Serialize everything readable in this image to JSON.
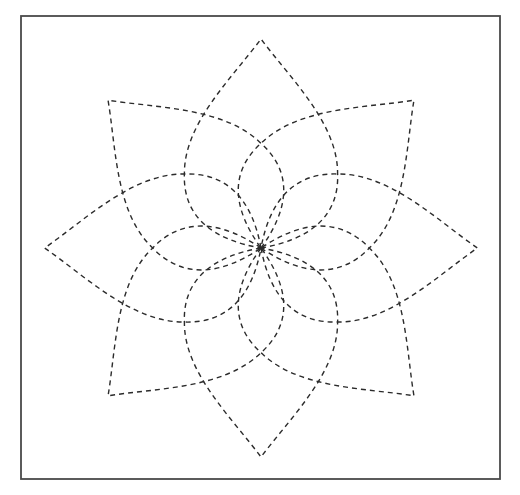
{
  "figure": {
    "title": "",
    "frame": {
      "x": 21,
      "y": 16,
      "width": 479,
      "height": 463,
      "stroke": "#4a4a4a"
    },
    "center": {
      "x": 261,
      "y": 248
    },
    "petal_count": 8,
    "petal_angle_step_deg": 45,
    "petal_length": 209,
    "horizontal_stretch": 1.035,
    "line_style": "dashed",
    "line_color": "#2b2b2b",
    "dash_pattern": "5 4",
    "petal_path": "M0,0 C45,-8 76,-30 74,-75 C74,-125 28,-170 0,-209 C-28,-170 -74,-125 -74,-75 C-76,-30 -45,-8 0,0 Z"
  }
}
